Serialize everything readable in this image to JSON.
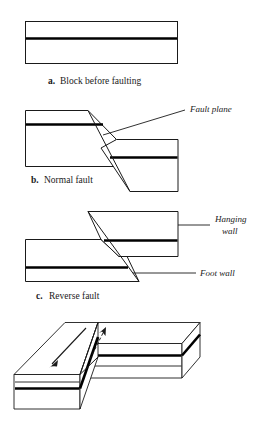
{
  "figure": {
    "panels": [
      {
        "id": "a",
        "letter": "a.",
        "caption": "Block before faulting",
        "description": "Single undeformed rectangular block with one horizontal marker stratum"
      },
      {
        "id": "b",
        "letter": "b.",
        "caption": "Normal fault",
        "description": "Hanging wall block has slipped downward along an inclined fault plane",
        "annotations": [
          {
            "label": "Fault plane",
            "style": "italic"
          }
        ]
      },
      {
        "id": "c",
        "letter": "c.",
        "caption": "Reverse fault",
        "description": "Hanging wall block has been pushed upward over the foot wall",
        "annotations": [
          {
            "label": "Hanging",
            "label_line2": "wall",
            "style": "italic"
          },
          {
            "label": "Foot wall",
            "style": "italic"
          }
        ]
      },
      {
        "id": "d",
        "letter": "",
        "caption": "",
        "description": "Three-dimensional block diagram of a strike-slip fault with opposing motion arrows",
        "annotations": []
      }
    ]
  },
  "colors": {
    "ink": "#1a1a1a",
    "stratum": "#000000",
    "background": "#ffffff"
  }
}
